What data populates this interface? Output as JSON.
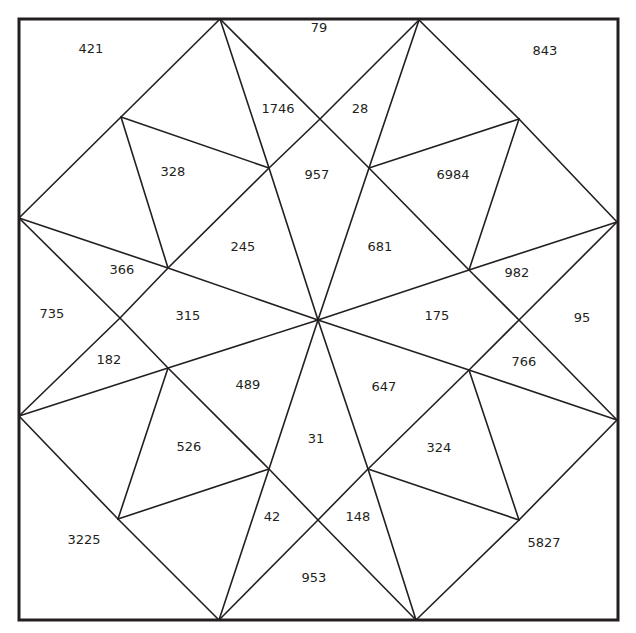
{
  "diagram": {
    "type": "triangulated-square-puzzle",
    "stroke_color": "#231f20",
    "frame": {
      "x1": 19,
      "y1": 19,
      "x2": 618,
      "y2": 620
    },
    "vertices": {
      "T1": [
        220,
        19
      ],
      "T2": [
        419,
        20
      ],
      "L1": [
        19,
        218
      ],
      "L2": [
        19,
        416
      ],
      "R1": [
        617,
        222
      ],
      "R2": [
        617,
        420
      ],
      "B1": [
        219,
        620
      ],
      "B2": [
        416,
        620
      ],
      "C": [
        318,
        320
      ],
      "a": [
        121,
        117
      ],
      "b": [
        269,
        168
      ],
      "c": [
        168,
        268
      ],
      "d": [
        120,
        318
      ],
      "e": [
        168,
        368
      ],
      "f": [
        269,
        469
      ],
      "g": [
        118,
        519
      ],
      "h": [
        320,
        119
      ],
      "i": [
        369,
        168
      ],
      "j": [
        519,
        119
      ],
      "k": [
        469,
        270
      ],
      "l": [
        519,
        320
      ],
      "m": [
        469,
        370
      ],
      "n": [
        368,
        469
      ],
      "o": [
        519,
        520
      ],
      "p": [
        318,
        520
      ]
    },
    "edges": [
      [
        "T1",
        "a"
      ],
      [
        "a",
        "L1"
      ],
      [
        "T1",
        "h"
      ],
      [
        "h",
        "T2"
      ],
      [
        "T2",
        "j"
      ],
      [
        "j",
        "R1"
      ],
      [
        "R1",
        "l"
      ],
      [
        "l",
        "R2"
      ],
      [
        "R2",
        "o"
      ],
      [
        "o",
        "B2"
      ],
      [
        "B2",
        "p"
      ],
      [
        "p",
        "B1"
      ],
      [
        "B1",
        "g"
      ],
      [
        "g",
        "L2"
      ],
      [
        "L2",
        "d"
      ],
      [
        "d",
        "L1"
      ],
      [
        "T1",
        "b"
      ],
      [
        "b",
        "C"
      ],
      [
        "T2",
        "i"
      ],
      [
        "i",
        "C"
      ],
      [
        "L1",
        "c"
      ],
      [
        "c",
        "C"
      ],
      [
        "L2",
        "e"
      ],
      [
        "e",
        "C"
      ],
      [
        "R1",
        "k"
      ],
      [
        "k",
        "C"
      ],
      [
        "R2",
        "m"
      ],
      [
        "m",
        "C"
      ],
      [
        "B1",
        "f"
      ],
      [
        "f",
        "C"
      ],
      [
        "B2",
        "n"
      ],
      [
        "n",
        "C"
      ],
      [
        "a",
        "b"
      ],
      [
        "a",
        "c"
      ],
      [
        "b",
        "c"
      ],
      [
        "h",
        "b"
      ],
      [
        "h",
        "i"
      ],
      [
        "i",
        "j"
      ],
      [
        "j",
        "k"
      ],
      [
        "i",
        "k"
      ],
      [
        "k",
        "l"
      ],
      [
        "l",
        "m"
      ],
      [
        "m",
        "o"
      ],
      [
        "o",
        "n"
      ],
      [
        "m",
        "n"
      ],
      [
        "n",
        "p"
      ],
      [
        "p",
        "f"
      ],
      [
        "f",
        "g"
      ],
      [
        "g",
        "e"
      ],
      [
        "e",
        "f"
      ],
      [
        "e",
        "d"
      ],
      [
        "d",
        "c"
      ]
    ],
    "labels": [
      {
        "text": "421",
        "x": 91,
        "y": 49
      },
      {
        "text": "79",
        "x": 319,
        "y": 28
      },
      {
        "text": "843",
        "x": 545,
        "y": 51
      },
      {
        "text": "1746",
        "x": 278,
        "y": 109
      },
      {
        "text": "28",
        "x": 360,
        "y": 109
      },
      {
        "text": "328",
        "x": 173,
        "y": 172
      },
      {
        "text": "957",
        "x": 317,
        "y": 175
      },
      {
        "text": "6984",
        "x": 453,
        "y": 175
      },
      {
        "text": "245",
        "x": 243,
        "y": 247
      },
      {
        "text": "681",
        "x": 380,
        "y": 247
      },
      {
        "text": "366",
        "x": 122,
        "y": 270
      },
      {
        "text": "982",
        "x": 517,
        "y": 273
      },
      {
        "text": "735",
        "x": 52,
        "y": 314
      },
      {
        "text": "315",
        "x": 188,
        "y": 316
      },
      {
        "text": "175",
        "x": 437,
        "y": 316
      },
      {
        "text": "95",
        "x": 582,
        "y": 318
      },
      {
        "text": "182",
        "x": 109,
        "y": 360
      },
      {
        "text": "766",
        "x": 524,
        "y": 362
      },
      {
        "text": "489",
        "x": 248,
        "y": 385
      },
      {
        "text": "647",
        "x": 384,
        "y": 387
      },
      {
        "text": "31",
        "x": 316,
        "y": 439
      },
      {
        "text": "526",
        "x": 189,
        "y": 447
      },
      {
        "text": "324",
        "x": 439,
        "y": 448
      },
      {
        "text": "42",
        "x": 272,
        "y": 517
      },
      {
        "text": "148",
        "x": 358,
        "y": 517
      },
      {
        "text": "3225",
        "x": 84,
        "y": 540
      },
      {
        "text": "5827",
        "x": 544,
        "y": 543
      },
      {
        "text": "953",
        "x": 314,
        "y": 578
      }
    ]
  }
}
